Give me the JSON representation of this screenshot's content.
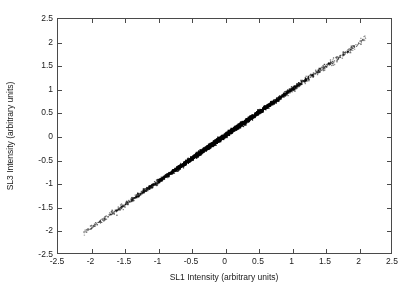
{
  "chart_data": {
    "type": "scatter",
    "title": "",
    "xlabel": "SL1 Intensity (arbitrary units)",
    "ylabel": "SL3 Intensity (arbitrary units)",
    "xlim": [
      -2.5,
      2.5
    ],
    "ylim": [
      -2.5,
      2.5
    ],
    "xticks": [
      -2.5,
      -2,
      -1.5,
      -1,
      -0.5,
      0,
      0.5,
      1,
      1.5,
      2,
      2.5
    ],
    "yticks": [
      -2.5,
      -2,
      -1.5,
      -1,
      -0.5,
      0,
      0.5,
      1,
      1.5,
      2,
      2.5
    ],
    "xticklabels": [
      "-2.5",
      "-2",
      "-1.5",
      "-1",
      "-0.5",
      "0",
      "0.5",
      "1",
      "1.5",
      "2",
      "2.5"
    ],
    "yticklabels": [
      "-2.5",
      "-2",
      "-1.5",
      "-1",
      "-0.5",
      "0",
      "0.5",
      "1",
      "1.5",
      "2",
      "2.5"
    ],
    "grid": false,
    "legend": null,
    "box": true,
    "tick_direction": "in",
    "marker": {
      "shape": "dot",
      "color": "#000000",
      "size": 1.4
    },
    "series": [
      {
        "name": "SL1 vs SL3",
        "relationship": "near-identity linear, slope approximately 0.98",
        "slope": 0.98,
        "intercept": 0.0,
        "data_range_x": [
          -2.12,
          2.12
        ],
        "data_range_y": [
          -2.08,
          2.05
        ],
        "scatter_sigma": 0.022,
        "n_points": 4200,
        "density": "very dense near origin, sparse gray tails beyond |x| = 1.6"
      }
    ]
  },
  "axes": {
    "x_title": "SL1 Intensity (arbitrary units)",
    "y_title": "SL3 Intensity (arbitrary units)"
  }
}
